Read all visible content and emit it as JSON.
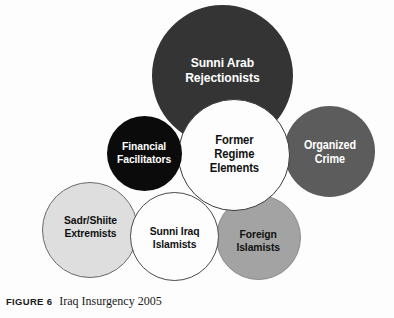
{
  "figure": {
    "caption_label": "FIGURE 6",
    "caption_text": "Iraq Insurgency 2005",
    "background_color": "#fdfdfd"
  },
  "diagram": {
    "type": "venn-bubble-cluster",
    "title": "Iraq Insurgency 2005",
    "bubbles": [
      {
        "id": "sunni-arab-rejectionists",
        "label": "Sunni Arab\nRejectionists",
        "fill": "#343434",
        "text_color": "#ffffff",
        "center_x": 222,
        "center_y": 75,
        "diameter": 141,
        "z": 2
      },
      {
        "id": "organized-crime",
        "label": "Organized\nCrime",
        "fill": "#5c5c5c",
        "text_color": "#ffffff",
        "center_x": 329,
        "center_y": 151,
        "diameter": 91,
        "z": 3
      },
      {
        "id": "former-regime-elements",
        "label": "Former\nRegime\nElements",
        "fill": "#fdfdfd",
        "stroke": "#3a3a3a",
        "text_color": "#111111",
        "center_x": 234,
        "center_y": 155,
        "diameter": 112,
        "z": 4
      },
      {
        "id": "financial-facilitators",
        "label": "Financial\nFacilitators",
        "fill": "#0b0b0b",
        "text_color": "#ffffff",
        "center_x": 144,
        "center_y": 153,
        "diameter": 75,
        "z": 5
      },
      {
        "id": "sadr-shiite-extremists",
        "label": "Sadr/Shiite\nExtremists",
        "fill": "#dedede",
        "stroke": "#6a6a6a",
        "text_color": "#111111",
        "center_x": 90,
        "center_y": 230,
        "diameter": 96,
        "z": 6
      },
      {
        "id": "sunni-iraq-islamists",
        "label": "Sunni Iraq\nIslamists",
        "fill": "#fdfdfd",
        "stroke": "#4a4a4a",
        "text_color": "#111111",
        "center_x": 174,
        "center_y": 236,
        "diameter": 89,
        "z": 7
      },
      {
        "id": "foreign-islamists",
        "label": "Foreign\nIslamists",
        "fill": "#a3a3a3",
        "stroke": "#8a8a8a",
        "text_color": "#111111",
        "center_x": 258,
        "center_y": 237,
        "diameter": 85,
        "z": 3
      }
    ]
  }
}
